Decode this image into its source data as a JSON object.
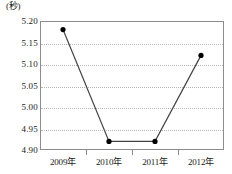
{
  "chart_data": {
    "type": "line",
    "title": "",
    "unit_label": "(秒)",
    "xlabel": "",
    "ylabel": "",
    "categories": [
      "2009年",
      "2010年",
      "2011年",
      "2012年"
    ],
    "values": [
      5.18,
      4.92,
      4.92,
      5.12
    ],
    "series": [
      {
        "name": "",
        "values": [
          5.18,
          4.92,
          4.92,
          5.12
        ]
      }
    ],
    "ylim": [
      4.9,
      5.2
    ],
    "yticks": [
      "5.20",
      "5.15",
      "5.10",
      "5.05",
      "5.00",
      "4.95",
      "4.90"
    ],
    "ytick_values": [
      5.2,
      5.15,
      5.1,
      5.05,
      5.0,
      4.95,
      4.9
    ],
    "grid": true,
    "legend": "none",
    "line_color": "#444444",
    "marker_color": "#000000"
  }
}
